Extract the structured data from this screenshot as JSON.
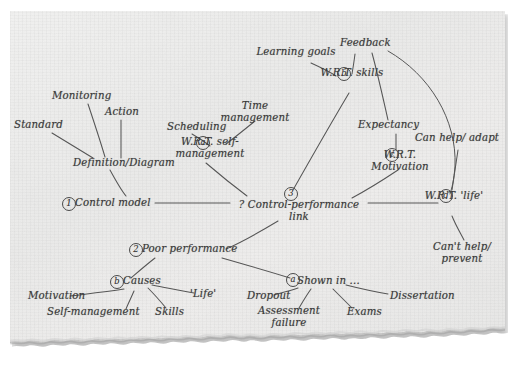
{
  "diagram": {
    "medium": "handwritten ink on torn notebook paper",
    "ink_color": "#3a3a3a",
    "paper_color": "#ecebea",
    "nodes": [
      {
        "id": "standard",
        "label": "Standard",
        "x": 14,
        "y": 125,
        "align": "left"
      },
      {
        "id": "monitoring",
        "label": "Monitoring",
        "x": 52,
        "y": 96,
        "align": "left"
      },
      {
        "id": "action",
        "label": "Action",
        "x": 105,
        "y": 112,
        "align": "left"
      },
      {
        "id": "definition",
        "label": "Definition/Diagram",
        "x": 73,
        "y": 163,
        "align": "left"
      },
      {
        "id": "control-model",
        "label": "Control model",
        "x": 75,
        "y": 203,
        "align": "left"
      },
      {
        "id": "scheduling",
        "label": "Scheduling",
        "x": 167,
        "y": 127,
        "align": "left"
      },
      {
        "id": "time-management",
        "label": "Time\nmanagement",
        "x": 255,
        "y": 106,
        "align": "center"
      },
      {
        "id": "wrt-self",
        "label": "W.R.T.\nself-management",
        "x": 210,
        "y": 142,
        "align": "center"
      },
      {
        "id": "learning-goals",
        "label": "Learning\ngoals",
        "x": 296,
        "y": 52,
        "align": "center"
      },
      {
        "id": "feedback",
        "label": "Feedback",
        "x": 340,
        "y": 43,
        "align": "left"
      },
      {
        "id": "wrt-skills",
        "label": "W.R.T.\nskills",
        "x": 350,
        "y": 73,
        "align": "center"
      },
      {
        "id": "expectancy",
        "label": "Expectancy",
        "x": 358,
        "y": 125,
        "align": "left"
      },
      {
        "id": "wrt-motivation",
        "label": "W.R.T.\nMotivation",
        "x": 398,
        "y": 155,
        "align": "center"
      },
      {
        "id": "can-help",
        "label": "Can help/\nadapt",
        "x": 455,
        "y": 138,
        "align": "center"
      },
      {
        "id": "wrt-life",
        "label": "W.R.T.\n'life'",
        "x": 452,
        "y": 196,
        "align": "center"
      },
      {
        "id": "cant-help",
        "label": "Can't help/\nprevent",
        "x": 460,
        "y": 247,
        "align": "center"
      },
      {
        "id": "control-perf",
        "label": "? Control-performance\nlink",
        "x": 289,
        "y": 205,
        "align": "center"
      },
      {
        "id": "poor-perf",
        "label": "Poor performance",
        "x": 142,
        "y": 249,
        "align": "left"
      },
      {
        "id": "causes",
        "label": "Causes",
        "x": 123,
        "y": 281,
        "align": "left"
      },
      {
        "id": "motivation",
        "label": "Motivation",
        "x": 28,
        "y": 296,
        "align": "left"
      },
      {
        "id": "self-management",
        "label": "Self-management",
        "x": 47,
        "y": 312,
        "align": "left"
      },
      {
        "id": "skills",
        "label": "Skills",
        "x": 155,
        "y": 312,
        "align": "left"
      },
      {
        "id": "life",
        "label": "'Life'",
        "x": 190,
        "y": 294,
        "align": "left"
      },
      {
        "id": "shown-in",
        "label": "Shown in ...",
        "x": 297,
        "y": 281,
        "align": "left"
      },
      {
        "id": "dropout",
        "label": "Dropout",
        "x": 247,
        "y": 296,
        "align": "left"
      },
      {
        "id": "assessment",
        "label": "Assessment\nfailure",
        "x": 287,
        "y": 311,
        "align": "center"
      },
      {
        "id": "exams",
        "label": "Exams",
        "x": 347,
        "y": 312,
        "align": "left"
      },
      {
        "id": "dissertation",
        "label": "Dissertation",
        "x": 390,
        "y": 296,
        "align": "left"
      }
    ],
    "markers": [
      {
        "id": "marker-1",
        "label": "1",
        "x": 62,
        "y": 201,
        "attached_to": "control-model"
      },
      {
        "id": "marker-2",
        "label": "2",
        "x": 129,
        "y": 247,
        "attached_to": "poor-perf"
      },
      {
        "id": "marker-3",
        "label": "3",
        "x": 284,
        "y": 191,
        "attached_to": "control-perf"
      },
      {
        "id": "marker-a",
        "label": "a",
        "x": 196,
        "y": 140,
        "attached_to": "wrt-self"
      },
      {
        "id": "marker-b",
        "label": "b",
        "x": 337,
        "y": 71,
        "attached_to": "wrt-skills"
      },
      {
        "id": "marker-c",
        "label": "c",
        "x": 385,
        "y": 152,
        "attached_to": "wrt-motivation"
      },
      {
        "id": "marker-d",
        "label": "d",
        "x": 439,
        "y": 193,
        "attached_to": "wrt-life"
      },
      {
        "id": "marker-a2",
        "label": "a",
        "x": 286,
        "y": 277,
        "attached_to": "shown-in"
      },
      {
        "id": "marker-b2",
        "label": "b",
        "x": 110,
        "y": 279,
        "attached_to": "causes"
      }
    ],
    "edges": [
      {
        "from": "standard",
        "to": "definition",
        "kind": "line"
      },
      {
        "from": "monitoring",
        "to": "definition",
        "kind": "line"
      },
      {
        "from": "action",
        "to": "definition",
        "kind": "line"
      },
      {
        "from": "definition",
        "to": "control-model",
        "kind": "line"
      },
      {
        "from": "control-model",
        "to": "control-perf",
        "kind": "line"
      },
      {
        "from": "scheduling",
        "to": "wrt-self",
        "kind": "line"
      },
      {
        "from": "time-management",
        "to": "wrt-self",
        "kind": "line"
      },
      {
        "from": "wrt-self",
        "to": "control-perf",
        "kind": "line"
      },
      {
        "from": "learning-goals",
        "to": "wrt-skills",
        "kind": "line"
      },
      {
        "from": "feedback",
        "to": "wrt-skills",
        "kind": "line"
      },
      {
        "from": "wrt-skills",
        "to": "control-perf",
        "kind": "line"
      },
      {
        "from": "feedback",
        "to": "expectancy",
        "kind": "line"
      },
      {
        "from": "feedback",
        "to": "wrt-life",
        "kind": "curve"
      },
      {
        "from": "expectancy",
        "to": "wrt-motivation",
        "kind": "line"
      },
      {
        "from": "wrt-motivation",
        "to": "control-perf",
        "kind": "line"
      },
      {
        "from": "control-perf",
        "to": "wrt-life",
        "kind": "line"
      },
      {
        "from": "wrt-life",
        "to": "can-help",
        "kind": "curve"
      },
      {
        "from": "wrt-life",
        "to": "cant-help",
        "kind": "curve"
      },
      {
        "from": "control-perf",
        "to": "poor-perf",
        "kind": "line"
      },
      {
        "from": "poor-perf",
        "to": "causes",
        "kind": "line"
      },
      {
        "from": "causes",
        "to": "motivation",
        "kind": "line"
      },
      {
        "from": "causes",
        "to": "self-management",
        "kind": "line"
      },
      {
        "from": "causes",
        "to": "skills",
        "kind": "line"
      },
      {
        "from": "causes",
        "to": "life",
        "kind": "line"
      },
      {
        "from": "poor-perf",
        "to": "shown-in",
        "kind": "line"
      },
      {
        "from": "shown-in",
        "to": "dropout",
        "kind": "line"
      },
      {
        "from": "shown-in",
        "to": "assessment",
        "kind": "line"
      },
      {
        "from": "shown-in",
        "to": "exams",
        "kind": "line"
      },
      {
        "from": "shown-in",
        "to": "dissertation",
        "kind": "line"
      }
    ]
  }
}
